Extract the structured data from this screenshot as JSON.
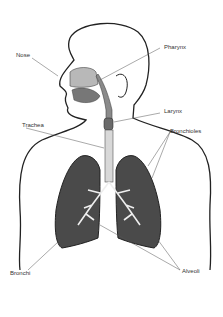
{
  "diagram": {
    "labels": {
      "nose": "Nose",
      "pharynx": "Pharynx",
      "larynx": "Larynx",
      "trachea": "Trachea",
      "bronchioles": "Bronchioles",
      "bronchi": "Bronchi",
      "alveoli": "Alveoli"
    },
    "colors": {
      "outline": "#222222",
      "lung_fill": "#4a4a4a",
      "airway_fill": "#8a8a8a",
      "nasal_fill": "#b8b8b8",
      "label_text": "#333333",
      "leader_line": "#555555"
    }
  }
}
